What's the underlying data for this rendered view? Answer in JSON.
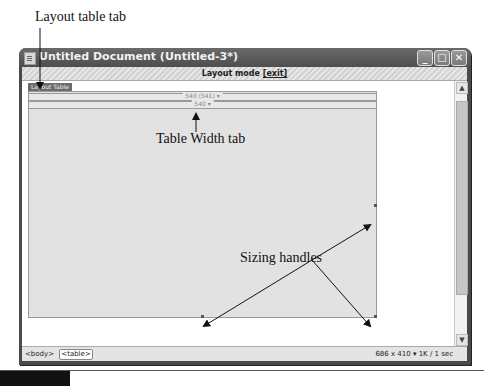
{
  "annotations": {
    "layout_table_tab": "Layout table tab",
    "table_width_tab": "Table Width tab",
    "sizing_handles": "Sizing handles"
  },
  "window": {
    "title": "Untitled Document (Untitled-3*)",
    "buttons": {
      "minimize": "_",
      "maximize": "□",
      "close": "✕"
    }
  },
  "modebar": {
    "label": "Layout mode",
    "exit_link": "[exit]"
  },
  "layout_table": {
    "tab_label": "Layout Table",
    "width_outer": "540 (541) ▾",
    "width_inner": "540 ▾"
  },
  "scrollbar": {
    "up": "▲",
    "down": "▼"
  },
  "statusbar": {
    "tags": [
      "<body>",
      "<table>"
    ],
    "dimensions": "686 x 410 ▾ 1K / 1 sec"
  }
}
